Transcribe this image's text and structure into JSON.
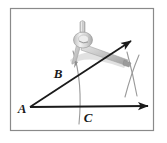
{
  "figure": {
    "kind": "geometry-construction-diagram",
    "background_color": "#ffffff",
    "frame": {
      "name": "figure-border",
      "stroke_color": "#8a8a8a",
      "x": 10.5,
      "y": 8.5,
      "width": 143,
      "height": 122
    },
    "labels": [
      {
        "id": "A",
        "text": "A",
        "x": 22,
        "y": 110,
        "font_size": 13
      },
      {
        "id": "B",
        "text": "B",
        "x": 58,
        "y": 75,
        "font_size": 13
      },
      {
        "id": "C",
        "text": "C",
        "x": 88,
        "y": 119,
        "font_size": 13
      }
    ],
    "rays": [
      {
        "name": "ray-AB-upper",
        "from": [
          30,
          107
        ],
        "to": [
          131,
          41
        ],
        "stroke_color": "#1a1a1a",
        "stroke_width": 1.8,
        "arrow": true
      },
      {
        "name": "ray-AC-horizontal",
        "from": [
          30,
          107
        ],
        "to": [
          148,
          106
        ],
        "stroke_color": "#1a1a1a",
        "stroke_width": 1.8,
        "arrow": true
      }
    ],
    "arcs": [
      {
        "name": "arc-through-B-and-C",
        "path": "M 73 51 Q 83 82 79 124",
        "stroke_color": "#9a9a9a",
        "stroke_width": 1.1
      },
      {
        "name": "arc-right-upper",
        "path": "M 127 52 Q 133 74 137 96",
        "stroke_color": "#9a9a9a",
        "stroke_width": 1.1
      },
      {
        "name": "arc-right-lower",
        "path": "M 139 55 Q 131 74 125 97",
        "stroke_color": "#9a9a9a",
        "stroke_width": 1.1
      }
    ],
    "compass": {
      "name": "compass-tool",
      "body_color": "#d9d9d9",
      "shadow_color": "#b5b5b5",
      "highlight_color": "#f1f1f1",
      "handle_top": [
        82,
        22
      ],
      "hinge": [
        83,
        44
      ],
      "leg_tip_left": [
        74,
        64
      ],
      "leg_tip_right": [
        126,
        62
      ]
    }
  }
}
